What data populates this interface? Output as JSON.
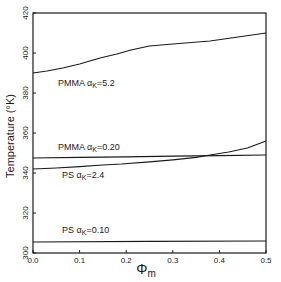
{
  "chart_data": {
    "type": "line",
    "title": "",
    "xlabel": "Φ",
    "xlabel_subscript": "m",
    "ylabel": "Temperature (°K)",
    "xlim": [
      0.0,
      0.5
    ],
    "ylim": [
      300,
      420
    ],
    "grid": false,
    "legend": "inline labels",
    "xticks": [
      0.0,
      0.1,
      0.2,
      0.3,
      0.4,
      0.5
    ],
    "xtick_labels": [
      "0.0",
      "0.1",
      "0.2",
      "0.3",
      "0.4",
      "0.5"
    ],
    "yticks": [
      300,
      320,
      340,
      360,
      380,
      400,
      420
    ],
    "ytick_labels": [
      "300",
      "320",
      "340",
      "360",
      "380",
      "400",
      "420"
    ],
    "series": [
      {
        "name": "PMMA αK=5.2",
        "label_main": "PMMA α",
        "label_sub": "K",
        "label_value": "=5.2",
        "x": [
          0.0,
          0.03,
          0.064,
          0.1,
          0.144,
          0.18,
          0.21,
          0.25,
          0.3,
          0.38,
          0.44,
          0.5
        ],
        "y": [
          390,
          391,
          392.5,
          394.5,
          397.5,
          399.5,
          401.5,
          403.5,
          404.5,
          406,
          408,
          410
        ]
      },
      {
        "name": "PMMA αK=0.20",
        "label_main": "PMMA α",
        "label_sub": "K",
        "label_value": "=0.20",
        "x": [
          0.0,
          0.1,
          0.2,
          0.3,
          0.4,
          0.5
        ],
        "y": [
          347.5,
          347.8,
          348.1,
          348.4,
          348.7,
          349
        ]
      },
      {
        "name": "PS αK=2.4",
        "label_main": "PS α",
        "label_sub": "K",
        "label_value": "=2.4",
        "x": [
          0.0,
          0.05,
          0.1,
          0.15,
          0.19,
          0.25,
          0.3,
          0.35,
          0.38,
          0.42,
          0.46,
          0.5
        ],
        "y": [
          342,
          342.5,
          343.2,
          344,
          344.5,
          345.6,
          346.6,
          347.8,
          349,
          350.5,
          352.5,
          356
        ]
      },
      {
        "name": "PS αK=0.10",
        "label_main": "PS α",
        "label_sub": "K",
        "label_value": "=0.10",
        "x": [
          0.0,
          0.25,
          0.5
        ],
        "y": [
          305.5,
          305.8,
          306
        ]
      }
    ]
  }
}
